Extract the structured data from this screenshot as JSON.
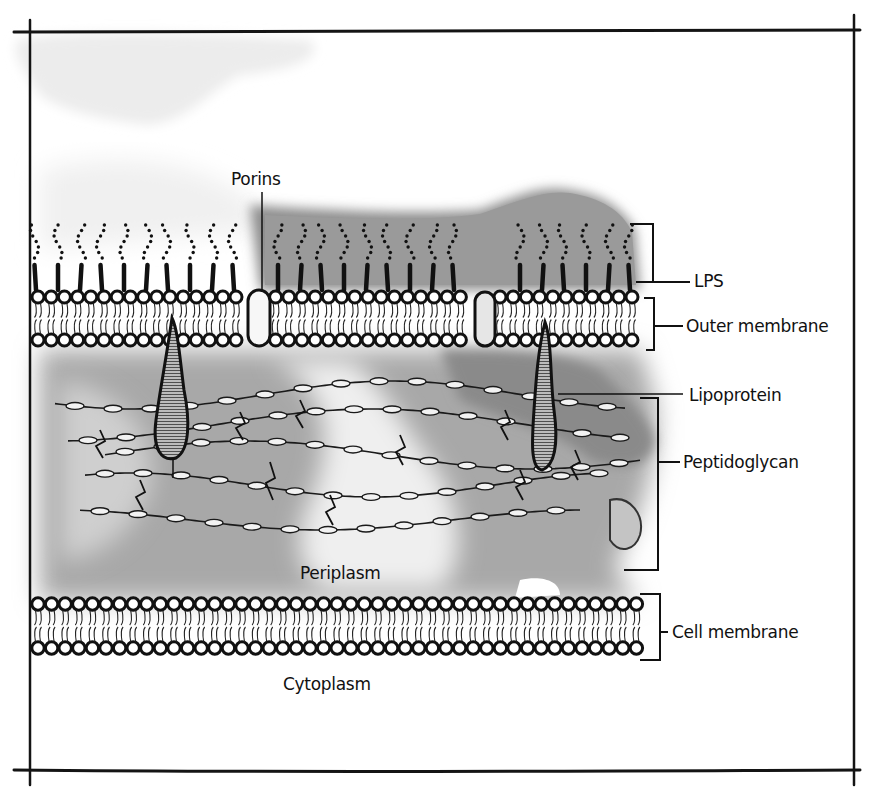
{
  "diagram": {
    "colors": {
      "ink": "#111111",
      "wash_dark": "#8a8a8a",
      "wash_mid": "#b4b4b4",
      "wash_light": "#e2e2e2",
      "paper": "#ffffff"
    },
    "labels": {
      "porins": "Porins",
      "lps": "LPS",
      "outer_membrane": "Outer membrane",
      "lipoprotein": "Lipoprotein",
      "peptidoglycan": "Peptidoglycan",
      "periplasm": "Periplasm",
      "cell_membrane": "Cell membrane",
      "cytoplasm": "Cytoplasm"
    },
    "layers": [
      {
        "name": "LPS",
        "y_top": 222,
        "y_bottom": 284
      },
      {
        "name": "Outer membrane",
        "y_top": 294,
        "y_bottom": 350
      },
      {
        "name": "Peptidoglycan",
        "y_top": 395,
        "y_bottom": 570
      },
      {
        "name": "Cell membrane",
        "y_top": 594,
        "y_bottom": 660
      }
    ]
  }
}
